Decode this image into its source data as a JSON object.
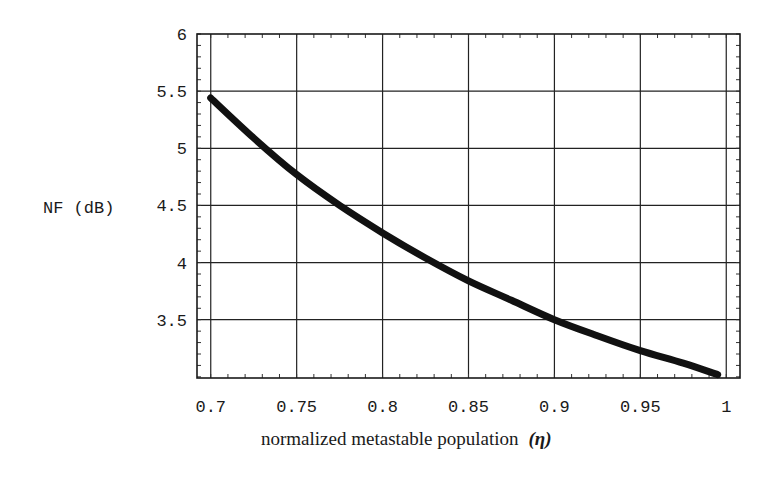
{
  "chart_data": {
    "type": "line",
    "title": "",
    "xlabel": "normalized metastable population",
    "xlabel_symbol": "(η)",
    "ylabel": "NF (dB)",
    "xlim": [
      0.692,
      1.008
    ],
    "ylim": [
      2.99,
      6.0
    ],
    "grid": true,
    "legend": null,
    "x_ticks": [
      0.7,
      0.75,
      0.8,
      0.85,
      0.9,
      0.95,
      1.0
    ],
    "x_tick_labels": [
      "0.7",
      "0.75",
      "0.8",
      "0.85",
      "0.9",
      "0.95",
      "1"
    ],
    "y_ticks": [
      3.5,
      4.0,
      4.5,
      5.0,
      5.5,
      6.0
    ],
    "y_tick_labels": [
      "3.5",
      "4",
      "4.5",
      "5",
      "5.5",
      "6"
    ],
    "x_minor_step": 0.01,
    "y_minor_step": 0.1,
    "series": [
      {
        "name": "NF",
        "color": "#111111",
        "x": [
          0.7,
          0.725,
          0.75,
          0.775,
          0.8,
          0.825,
          0.85,
          0.875,
          0.9,
          0.925,
          0.95,
          0.975,
          0.995
        ],
        "y": [
          5.44,
          5.09,
          4.77,
          4.5,
          4.26,
          4.04,
          3.84,
          3.67,
          3.5,
          3.36,
          3.23,
          3.12,
          3.02
        ]
      }
    ]
  }
}
